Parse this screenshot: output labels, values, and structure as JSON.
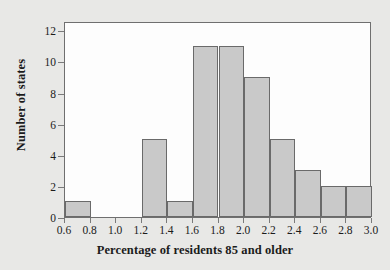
{
  "chart_data": {
    "type": "bar",
    "title": "",
    "subtitle": "",
    "xlabel": "Percentage of residents 85 and older",
    "ylabel": "Number of states",
    "bin_edges": [
      0.6,
      0.8,
      1.0,
      1.2,
      1.4,
      1.6,
      1.8,
      2.0,
      2.2,
      2.4,
      2.6,
      2.8,
      3.0
    ],
    "categories": [
      "0.6-0.8",
      "0.8-1.0",
      "1.0-1.2",
      "1.2-1.4",
      "1.4-1.6",
      "1.6-1.8",
      "1.8-2.0",
      "2.0-2.2",
      "2.2-2.4",
      "2.4-2.6",
      "2.6-2.8",
      "2.8-3.0"
    ],
    "values": [
      1,
      0,
      0,
      5,
      1,
      11,
      11,
      9,
      5,
      3,
      2,
      2
    ],
    "xlim": [
      0.6,
      3.0
    ],
    "ylim": [
      0,
      12.6
    ],
    "xticks": [
      0.6,
      0.8,
      1.0,
      1.2,
      1.4,
      1.6,
      1.8,
      2.0,
      2.2,
      2.4,
      2.6,
      2.8,
      3.0
    ],
    "xtick_labels": [
      "0.6",
      "0.8",
      "1.0",
      "1.2",
      "1.4",
      "1.6",
      "1.8",
      "2.0",
      "2.2",
      "2.4",
      "2.6",
      "2.8",
      "3.0"
    ],
    "yticks": [
      0,
      2,
      4,
      6,
      8,
      10,
      12
    ],
    "ytick_labels": [
      "0",
      "2",
      "4",
      "6",
      "8",
      "10",
      "12"
    ],
    "grid": false,
    "legend": false,
    "bar_fill_color": "#c9c9c9",
    "bar_edge_color": "#6a6a6a",
    "plot_background_color": "#fdfdfd",
    "figure_background_color": "#e8e8e6",
    "axis_color": "#6f6f6f",
    "text_color": "#1b1b1b"
  }
}
